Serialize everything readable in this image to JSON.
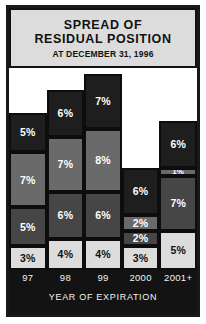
{
  "title": {
    "line1": "SPREAD OF",
    "line2": "RESIDUAL POSITION",
    "subtitle": "AT DECEMBER 31, 1996"
  },
  "axis": {
    "xlabel": "YEAR OF EXPIRATION"
  },
  "colors": {
    "frame": "#181818",
    "title_panel_bg": "#dcdcdc",
    "axis_strip_bg": "#131313",
    "segment_dark": "#1e1e1e",
    "segment_medium_light": "#6a6a6a",
    "segment_medium_dark": "#464646",
    "segment_light": "#dcdcdc",
    "label_light": "#ffffff",
    "label_dark": "#111111",
    "plot_bg": "#ffffff"
  },
  "chart_data": {
    "type": "bar",
    "title": "SPREAD OF RESIDUAL POSITION",
    "subtitle": "AT DECEMBER 31, 1996",
    "xlabel": "YEAR OF EXPIRATION",
    "ylabel": "",
    "stacked": true,
    "grid": false,
    "legend": "none",
    "units": "percent",
    "ylim": [
      0,
      26
    ],
    "categories": [
      "97",
      "98",
      "99",
      "2000",
      "2001+"
    ],
    "series": [
      {
        "name": "band-1-bottom",
        "shade": "light",
        "values": [
          3,
          4,
          4,
          3,
          5
        ]
      },
      {
        "name": "band-2",
        "shade": "medium-dark",
        "values": [
          5,
          6,
          6,
          2,
          7
        ]
      },
      {
        "name": "band-3",
        "shade": "medium-light",
        "values": [
          7,
          7,
          8,
          2,
          1
        ]
      },
      {
        "name": "band-4-top",
        "shade": "dark",
        "values": [
          5,
          6,
          7,
          6,
          6
        ]
      }
    ],
    "totals": [
      20,
      23,
      25,
      13,
      19
    ]
  },
  "bars": [
    {
      "category": "97",
      "segments": [
        {
          "label": "5%",
          "value": 5,
          "shade": "dark"
        },
        {
          "label": "7%",
          "value": 7,
          "shade": "medium-light"
        },
        {
          "label": "5%",
          "value": 5,
          "shade": "medium-dark"
        },
        {
          "label": "3%",
          "value": 3,
          "shade": "light"
        }
      ]
    },
    {
      "category": "98",
      "segments": [
        {
          "label": "6%",
          "value": 6,
          "shade": "dark"
        },
        {
          "label": "7%",
          "value": 7,
          "shade": "medium-light"
        },
        {
          "label": "6%",
          "value": 6,
          "shade": "medium-dark"
        },
        {
          "label": "4%",
          "value": 4,
          "shade": "light"
        }
      ]
    },
    {
      "category": "99",
      "segments": [
        {
          "label": "7%",
          "value": 7,
          "shade": "dark"
        },
        {
          "label": "8%",
          "value": 8,
          "shade": "medium-light"
        },
        {
          "label": "6%",
          "value": 6,
          "shade": "medium-dark"
        },
        {
          "label": "4%",
          "value": 4,
          "shade": "light"
        }
      ]
    },
    {
      "category": "2000",
      "segments": [
        {
          "label": "6%",
          "value": 6,
          "shade": "dark"
        },
        {
          "label": "2%",
          "value": 2,
          "shade": "medium-light"
        },
        {
          "label": "2%",
          "value": 2,
          "shade": "medium-dark"
        },
        {
          "label": "3%",
          "value": 3,
          "shade": "light"
        }
      ]
    },
    {
      "category": "2001+",
      "segments": [
        {
          "label": "6%",
          "value": 6,
          "shade": "dark"
        },
        {
          "label": "1%",
          "value": 1,
          "shade": "medium-light"
        },
        {
          "label": "7%",
          "value": 7,
          "shade": "medium-dark"
        },
        {
          "label": "5%",
          "value": 5,
          "shade": "light"
        }
      ]
    }
  ]
}
